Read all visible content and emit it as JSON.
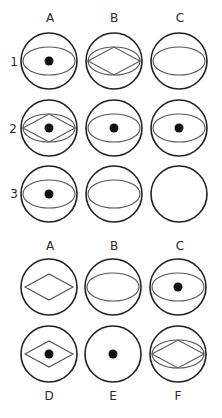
{
  "puzzle": {
    "columns": [
      "A",
      "B",
      "C"
    ],
    "rows": [
      "1",
      "2",
      "3"
    ],
    "grid": [
      [
        {
          "ellipse": true,
          "diamond": false,
          "dot": true
        },
        {
          "ellipse": true,
          "diamond": true,
          "dot": false
        },
        {
          "ellipse": true,
          "diamond": false,
          "dot": false
        }
      ],
      [
        {
          "ellipse": true,
          "diamond": true,
          "dot": true
        },
        {
          "ellipse": true,
          "diamond": false,
          "dot": true
        },
        {
          "ellipse": true,
          "diamond": false,
          "dot": true
        }
      ],
      [
        {
          "ellipse": true,
          "diamond": false,
          "dot": true
        },
        {
          "ellipse": true,
          "diamond": false,
          "dot": false
        },
        {
          "ellipse": false,
          "diamond": false,
          "dot": false
        }
      ]
    ]
  },
  "answers": {
    "top_labels": [
      "A",
      "B",
      "C"
    ],
    "bottom_labels": [
      "D",
      "E",
      "F"
    ],
    "options": [
      {
        "label": "A",
        "ellipse": false,
        "diamond": true,
        "dot": false
      },
      {
        "label": "B",
        "ellipse": true,
        "diamond": false,
        "dot": false
      },
      {
        "label": "C",
        "ellipse": true,
        "diamond": false,
        "dot": true
      },
      {
        "label": "D",
        "ellipse": false,
        "diamond": true,
        "dot": true
      },
      {
        "label": "E",
        "ellipse": false,
        "diamond": false,
        "dot": true
      },
      {
        "label": "F",
        "ellipse": true,
        "diamond": true,
        "dot": false
      }
    ]
  },
  "colors": {
    "circle_stroke": "#222222",
    "inner_stroke": "#555555",
    "dot_fill": "#111111"
  }
}
